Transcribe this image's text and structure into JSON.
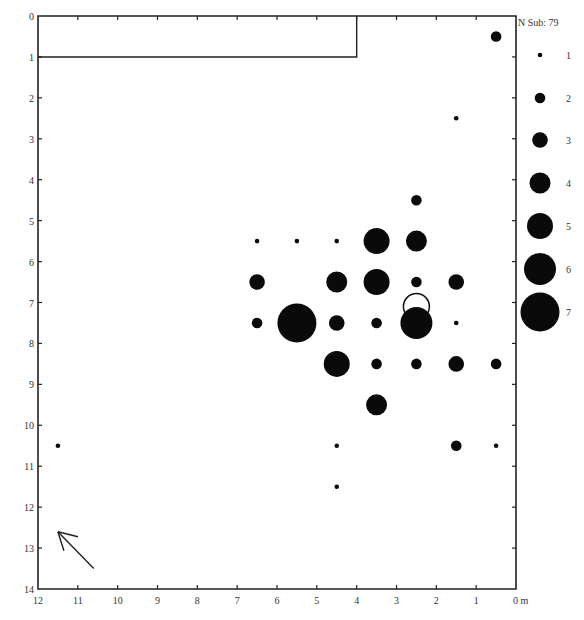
{
  "chart_data": {
    "type": "scatter",
    "subtype": "bubble-distribution-plan",
    "title": "",
    "xlabel": "m",
    "ylabel": "",
    "x_axis": {
      "direction": "reversed",
      "range": [
        12,
        0
      ],
      "ticks": [
        12,
        11,
        10,
        9,
        8,
        7,
        6,
        5,
        4,
        3,
        2,
        1,
        0
      ],
      "tick_labels": [
        "12",
        "11",
        "10",
        "9",
        "8",
        "7",
        "6",
        "5",
        "4",
        "3",
        "2",
        "1",
        "0 m"
      ]
    },
    "y_axis": {
      "direction": "top-down",
      "range": [
        0,
        14
      ],
      "ticks": [
        0,
        1,
        2,
        3,
        4,
        5,
        6,
        7,
        8,
        9,
        10,
        11,
        12,
        13,
        14
      ],
      "tick_labels": [
        "0",
        "1",
        "2",
        "3",
        "4",
        "5",
        "6",
        "7",
        "8",
        "9",
        "10",
        "11",
        "12",
        "13",
        "14"
      ]
    },
    "grid": false,
    "legend": {
      "position": "right",
      "title": "N Sub: 79",
      "entries": [
        {
          "label": "1",
          "value": 1
        },
        {
          "label": "2",
          "value": 2
        },
        {
          "label": "3",
          "value": 3
        },
        {
          "label": "4",
          "value": 4
        },
        {
          "label": "5",
          "value": 5
        },
        {
          "label": "6",
          "value": 6
        },
        {
          "label": "7",
          "value": 7
        }
      ]
    },
    "points": [
      {
        "x": 0.5,
        "y": 0.5,
        "n": 2
      },
      {
        "x": 1.5,
        "y": 2.5,
        "n": 1
      },
      {
        "x": 2.5,
        "y": 4.5,
        "n": 2
      },
      {
        "x": 6.5,
        "y": 5.5,
        "n": 1
      },
      {
        "x": 5.5,
        "y": 5.5,
        "n": 1
      },
      {
        "x": 4.5,
        "y": 5.5,
        "n": 1
      },
      {
        "x": 3.5,
        "y": 5.5,
        "n": 5
      },
      {
        "x": 2.5,
        "y": 5.5,
        "n": 4
      },
      {
        "x": 6.5,
        "y": 6.5,
        "n": 3
      },
      {
        "x": 4.5,
        "y": 6.5,
        "n": 4
      },
      {
        "x": 3.5,
        "y": 6.5,
        "n": 5
      },
      {
        "x": 2.5,
        "y": 6.5,
        "n": 2
      },
      {
        "x": 1.5,
        "y": 6.5,
        "n": 3
      },
      {
        "x": 6.5,
        "y": 7.5,
        "n": 2
      },
      {
        "x": 5.5,
        "y": 7.5,
        "n": 7
      },
      {
        "x": 4.5,
        "y": 7.5,
        "n": 3
      },
      {
        "x": 3.5,
        "y": 7.5,
        "n": 2
      },
      {
        "x": 2.5,
        "y": 7.5,
        "n": 6
      },
      {
        "x": 1.5,
        "y": 7.5,
        "n": 1
      },
      {
        "x": 4.5,
        "y": 8.5,
        "n": 5
      },
      {
        "x": 3.5,
        "y": 8.5,
        "n": 2
      },
      {
        "x": 2.5,
        "y": 8.5,
        "n": 2
      },
      {
        "x": 1.5,
        "y": 8.5,
        "n": 3
      },
      {
        "x": 0.5,
        "y": 8.5,
        "n": 2
      },
      {
        "x": 3.5,
        "y": 9.5,
        "n": 4
      },
      {
        "x": 11.5,
        "y": 10.5,
        "n": 1
      },
      {
        "x": 4.5,
        "y": 10.5,
        "n": 1
      },
      {
        "x": 1.5,
        "y": 10.5,
        "n": 2
      },
      {
        "x": 0.5,
        "y": 10.5,
        "n": 1
      },
      {
        "x": 4.5,
        "y": 11.5,
        "n": 1
      }
    ],
    "annotations": [
      {
        "type": "rectangle",
        "label": "excavated/structure outline",
        "x0": 12,
        "x1": 4,
        "y0": 0,
        "y1": 1
      },
      {
        "type": "open-circle",
        "x": 2.5,
        "y": 7.1,
        "radius_m": 0.32
      },
      {
        "type": "north-arrow",
        "from": {
          "x": 10.6,
          "y": 13.5
        },
        "to": {
          "x": 11.5,
          "y": 12.6
        }
      }
    ]
  },
  "legend_title": "N Sub: 79"
}
